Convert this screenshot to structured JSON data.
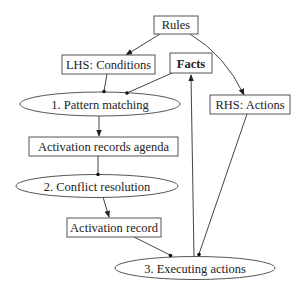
{
  "diagram": {
    "nodes": {
      "rules": {
        "label": "Rules",
        "shape": "box"
      },
      "lhs": {
        "label": "LHS: Conditions",
        "shape": "box"
      },
      "facts": {
        "label": "Facts",
        "shape": "box",
        "bold": true
      },
      "rhs": {
        "label": "RHS: Actions",
        "shape": "box"
      },
      "pattern": {
        "label": "1. Pattern matching",
        "shape": "ellipse"
      },
      "agenda": {
        "label": "Activation records agenda",
        "shape": "box"
      },
      "conflict": {
        "label": "2. Conflict resolution",
        "shape": "ellipse"
      },
      "record": {
        "label": "Activation record",
        "shape": "box"
      },
      "executing": {
        "label": "3. Executing actions",
        "shape": "ellipse"
      }
    },
    "edges": [
      {
        "from": "rules",
        "to": "lhs",
        "type": "arrow"
      },
      {
        "from": "rules",
        "to": "rhs",
        "type": "arrow"
      },
      {
        "from": "lhs",
        "to": "pattern",
        "type": "dot"
      },
      {
        "from": "facts",
        "to": "pattern",
        "type": "dot"
      },
      {
        "from": "pattern",
        "to": "agenda",
        "type": "arrow"
      },
      {
        "from": "agenda",
        "to": "conflict",
        "type": "dot"
      },
      {
        "from": "conflict",
        "to": "record",
        "type": "arrow"
      },
      {
        "from": "record",
        "to": "executing",
        "type": "dot"
      },
      {
        "from": "rhs",
        "to": "executing",
        "type": "dot"
      },
      {
        "from": "executing",
        "to": "facts",
        "type": "arrow"
      }
    ]
  }
}
